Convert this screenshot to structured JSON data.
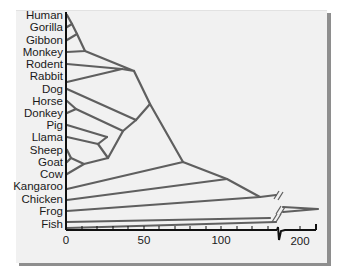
{
  "diagram": {
    "type": "phylogenetic-tree",
    "taxa": [
      "Human",
      "Gorilla",
      "Gibbon",
      "Monkey",
      "Rodent",
      "Rabbit",
      "Dog",
      "Horse",
      "Donkey",
      "Pig",
      "Llama",
      "Sheep",
      "Goat",
      "Cow",
      "Kangaroo",
      "Chicken",
      "Frog",
      "Fish"
    ],
    "x_axis": {
      "ticks": [
        {
          "value": "0"
        },
        {
          "value": "50"
        },
        {
          "value": "100"
        },
        {
          "value": "200"
        }
      ],
      "has_axis_break": true
    },
    "colors": {
      "branch": "#5f5f5f",
      "axis": "#111111",
      "panel": "#f1f1f1",
      "shadow": "#8e8e8e"
    }
  }
}
